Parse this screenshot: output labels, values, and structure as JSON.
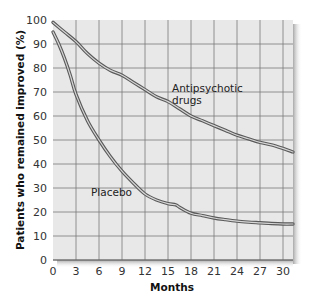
{
  "chart_data": {
    "type": "line",
    "title": "",
    "xlabel": "Months",
    "ylabel": "Patients who remained improved (%)",
    "xlim": [
      0,
      31.3
    ],
    "ylim": [
      0,
      100
    ],
    "xticks": [
      0,
      3,
      6,
      9,
      12,
      15,
      18,
      21,
      24,
      27,
      30
    ],
    "yticks": [
      0,
      10,
      20,
      30,
      40,
      50,
      60,
      70,
      80,
      90,
      100
    ],
    "grid": true,
    "legend": "inline labels",
    "series": [
      {
        "name": "Antipsychotic drugs",
        "label_lines": [
          "Antipsychotic",
          "drugs"
        ],
        "x": [
          0,
          1.5,
          3,
          4.5,
          6,
          7.5,
          9,
          10.5,
          12,
          13.5,
          15,
          16.5,
          18,
          19.5,
          21,
          22.5,
          24,
          25.5,
          27,
          28.5,
          30,
          31.3
        ],
        "values": [
          99,
          95,
          91,
          86,
          82,
          79,
          77,
          74,
          71,
          68,
          66,
          63,
          60,
          58,
          56,
          54,
          52,
          50.5,
          49,
          48,
          46.5,
          45
        ]
      },
      {
        "name": "Placebo",
        "label_lines": [
          "Placebo"
        ],
        "x": [
          0,
          0.75,
          1.5,
          2.25,
          3,
          4.5,
          6,
          7.5,
          9,
          10.5,
          12,
          13.5,
          15,
          16,
          16.5,
          18,
          19.5,
          21,
          22.5,
          24,
          25.5,
          27,
          28.5,
          30,
          31.3
        ],
        "values": [
          95,
          90,
          84,
          77,
          69,
          58,
          50,
          43,
          37,
          32,
          27.5,
          25,
          23.5,
          23,
          22,
          19.5,
          18.5,
          17.5,
          16.8,
          16.2,
          15.8,
          15.5,
          15.2,
          15,
          15
        ]
      }
    ]
  },
  "colors": {
    "plot_background": "#e8e8e8",
    "grid": "#7a7a7a",
    "curve_outline": "#5a5a5a",
    "curve_center": "#d6d6d6",
    "shadow": "#bdbdbd"
  },
  "labels": {
    "xlabel": "Months",
    "ylabel": "Patients who remained improved (%)",
    "antipsychotic_line1": "Antipsychotic",
    "antipsychotic_line2": "drugs",
    "placebo": "Placebo"
  }
}
